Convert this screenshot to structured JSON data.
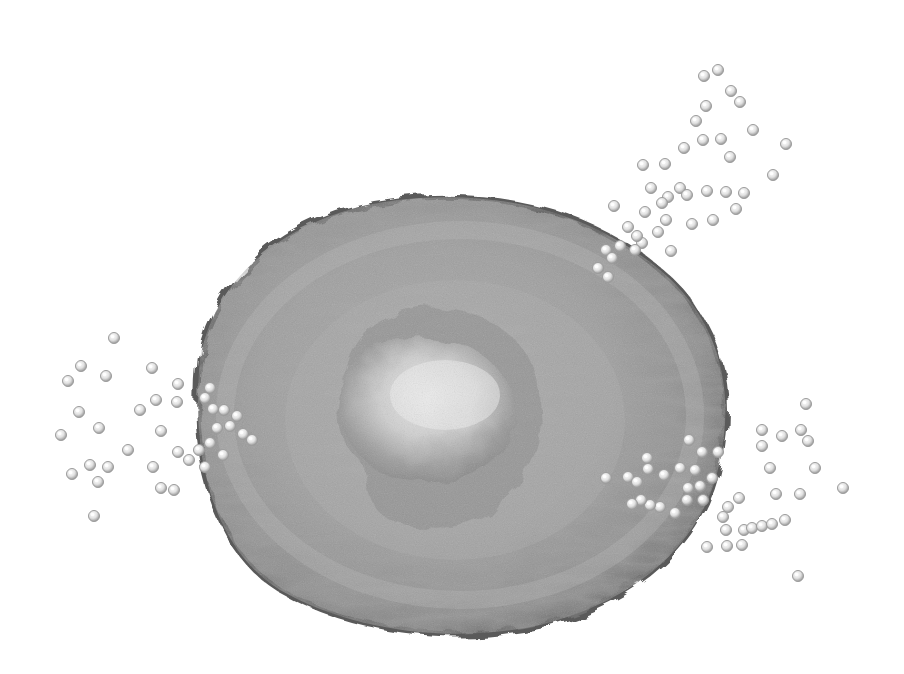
{
  "image": {
    "description": "Grayscale 3D render of a rounded cell with a textured wrinkled membrane and a central nucleus, with clusters of small spherical particles attaching at the left, upper-right and lower-right edges",
    "background": "#ffffff",
    "cell": {
      "cx": 460,
      "cy": 415,
      "rx": 268,
      "ry": 215,
      "fill": "#9a9a9a",
      "edge": "#6a6a6a",
      "highlight": "#c8c8c8"
    },
    "nucleus": {
      "cx": 440,
      "cy": 420,
      "rx": 100,
      "ry": 100,
      "fill": "#d6d6d6",
      "shadow": "#7d7d7d"
    },
    "particle_clusters": [
      {
        "name": "left-cluster",
        "particles": [
          [
            114,
            338
          ],
          [
            81,
            366
          ],
          [
            106,
            376
          ],
          [
            152,
            368
          ],
          [
            68,
            381
          ],
          [
            178,
            384
          ],
          [
            79,
            412
          ],
          [
            140,
            410
          ],
          [
            156,
            400
          ],
          [
            177,
            402
          ],
          [
            61,
            435
          ],
          [
            99,
            428
          ],
          [
            161,
            431
          ],
          [
            128,
            450
          ],
          [
            90,
            465
          ],
          [
            108,
            467
          ],
          [
            72,
            474
          ],
          [
            153,
            467
          ],
          [
            98,
            482
          ],
          [
            161,
            488
          ],
          [
            174,
            490
          ],
          [
            94,
            516
          ],
          [
            210,
            388
          ],
          [
            205,
            398
          ],
          [
            213,
            409
          ],
          [
            217,
            428
          ],
          [
            230,
            426
          ],
          [
            237,
            416
          ],
          [
            243,
            434
          ],
          [
            210,
            443
          ],
          [
            199,
            450
          ],
          [
            223,
            455
          ],
          [
            205,
            467
          ],
          [
            178,
            452
          ],
          [
            189,
            460
          ],
          [
            224,
            410
          ],
          [
            252,
            440
          ]
        ]
      },
      {
        "name": "upper-right-cluster",
        "particles": [
          [
            704,
            76
          ],
          [
            718,
            70
          ],
          [
            731,
            91
          ],
          [
            740,
            102
          ],
          [
            706,
            106
          ],
          [
            696,
            121
          ],
          [
            753,
            130
          ],
          [
            786,
            144
          ],
          [
            703,
            140
          ],
          [
            721,
            139
          ],
          [
            684,
            148
          ],
          [
            730,
            157
          ],
          [
            643,
            165
          ],
          [
            665,
            164
          ],
          [
            773,
            175
          ],
          [
            680,
            188
          ],
          [
            668,
            197
          ],
          [
            651,
            188
          ],
          [
            687,
            195
          ],
          [
            726,
            192
          ],
          [
            744,
            193
          ],
          [
            707,
            191
          ],
          [
            662,
            203
          ],
          [
            736,
            209
          ],
          [
            645,
            212
          ],
          [
            666,
            220
          ],
          [
            658,
            232
          ],
          [
            692,
            224
          ],
          [
            713,
            220
          ],
          [
            614,
            206
          ],
          [
            642,
            243
          ],
          [
            620,
            246
          ],
          [
            635,
            250
          ],
          [
            628,
            227
          ],
          [
            606,
            250
          ],
          [
            612,
            258
          ],
          [
            598,
            268
          ],
          [
            608,
            277
          ],
          [
            671,
            251
          ],
          [
            637,
            236
          ]
        ]
      },
      {
        "name": "lower-right-cluster",
        "particles": [
          [
            806,
            404
          ],
          [
            762,
            430
          ],
          [
            782,
            436
          ],
          [
            801,
            430
          ],
          [
            808,
            441
          ],
          [
            762,
            446
          ],
          [
            770,
            468
          ],
          [
            815,
            468
          ],
          [
            843,
            488
          ],
          [
            776,
            494
          ],
          [
            800,
            494
          ],
          [
            798,
            576
          ],
          [
            739,
            498
          ],
          [
            728,
            507
          ],
          [
            723,
            517
          ],
          [
            726,
            530
          ],
          [
            744,
            530
          ],
          [
            752,
            528
          ],
          [
            762,
            526
          ],
          [
            772,
            524
          ],
          [
            785,
            520
          ],
          [
            707,
            547
          ],
          [
            727,
            546
          ],
          [
            742,
            545
          ],
          [
            689,
            440
          ],
          [
            702,
            452
          ],
          [
            718,
            452
          ],
          [
            647,
            458
          ],
          [
            648,
            469
          ],
          [
            664,
            475
          ],
          [
            628,
            477
          ],
          [
            606,
            478
          ],
          [
            637,
            482
          ],
          [
            680,
            468
          ],
          [
            695,
            470
          ],
          [
            688,
            488
          ],
          [
            700,
            486
          ],
          [
            712,
            478
          ],
          [
            703,
            500
          ],
          [
            687,
            500
          ],
          [
            675,
            513
          ],
          [
            660,
            507
          ],
          [
            650,
            505
          ],
          [
            641,
            500
          ],
          [
            632,
            504
          ]
        ]
      }
    ]
  }
}
